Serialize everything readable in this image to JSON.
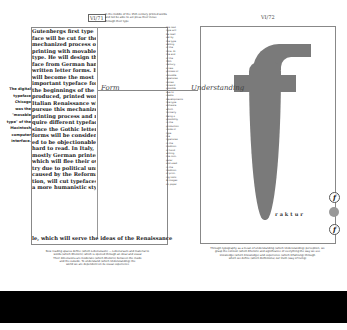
{
  "left_page": {
    "page_number": "VI/71",
    "header_note": "In the middle of the 15th century printed words and not be able to set press their incise through their type",
    "body_lines": [
      "Gutenbergs first type",
      "face will be cut for the",
      "mechanized process of",
      "printing with movable",
      "type. He will design this",
      "face from German hand",
      "written letter forms. It",
      "will become the most",
      "important typeface for",
      "the beginnings of the mass",
      "produced, printed work.",
      "Italian Renaissance will",
      "pursue this mechanized",
      "printing process and re",
      "quire different typefaces,",
      "since the Gothic letter",
      "forms will be consider",
      "ed to be objectionable and",
      "hard to read. In Italy,",
      "mostly German printers",
      "which will flee their own",
      "try due to political unrest,",
      "caused by the Reforma",
      "tion, will cut typefaces in",
      "a more humanistic sty"
    ],
    "bottom_line": "le, which will serve the ideas of the Renaissance",
    "side_text": [
      "The digital",
      "typeface",
      "Chicago",
      "was the",
      "\"movable",
      "type\" of the",
      "Macintosh",
      "computer",
      "interface."
    ],
    "right_column": [
      "the next",
      "type will",
      "be itself",
      "set by",
      "the type",
      "setting",
      "of the",
      "time. At",
      "the end",
      "of the",
      "20th",
      "century,",
      "a new",
      "process of",
      "movable",
      "typefaces",
      "comes",
      "forward",
      "possible",
      "due to",
      "media",
      "developments",
      "like type",
      "software",
      "which",
      "formerly",
      "being a",
      "possibility",
      "in the",
      "production",
      "mode of",
      "type",
      "the",
      "typefaces",
      "in the",
      "tradition",
      "of hand",
      "writing,",
      "the com-",
      "puter",
      "and used",
      "in the",
      "tradition",
      "of print-",
      "ing tools",
      "& images",
      "on paper"
    ],
    "form_label": "Form",
    "caption": [
      "New reading spaces define (which Lebensraum) — Lebensraum and material to",
      "words (which Rhetoric) which is opened through an ideal and visual",
      "Their dimensions are moderate (which Rhetoric) between the inside",
      "and the outside. To understand (which Understanding) the",
      "world we are dependent on its visual experience"
    ]
  },
  "right_page": {
    "page_number": "VI/72",
    "understanding_label": "Understanding",
    "fraktur_label": "raktur",
    "icons": [
      "f-letter-icon",
      "globe-icon",
      "f-letter-icon"
    ],
    "icon_glyphs": [
      "f",
      "",
      "f"
    ],
    "caption": [
      "Through typography as a mean of understanding (which Understanding) perception, we",
      "grasp the context (which Rhetoric and significance of everything the way we see",
      "knowledge (which Knowledge) and experience (which Erfahrung) through",
      "which we define (which Definitions) our truth (way of living)"
    ]
  },
  "colors": {
    "glyph_gray": "#7a7a7a",
    "frame": "#888888",
    "bar": "#000000"
  }
}
